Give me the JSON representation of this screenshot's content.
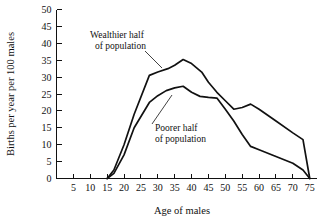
{
  "chart_data": {
    "type": "line",
    "title": "",
    "xlabel": "Age of males",
    "ylabel": "Births per year per 100 males",
    "xlim": [
      0,
      77
    ],
    "ylim": [
      0,
      50
    ],
    "grid": false,
    "legend_position": "inline-annotations",
    "x_ticks": [
      5,
      10,
      15,
      20,
      25,
      30,
      35,
      40,
      45,
      50,
      55,
      60,
      65,
      70,
      75
    ],
    "y_ticks": [
      0,
      5,
      10,
      15,
      20,
      25,
      30,
      35,
      40,
      45,
      50
    ],
    "annotations": [
      {
        "text_line1": "Wealthier half",
        "text_line2": "of population",
        "points_to_series": "Wealthier half of population"
      },
      {
        "text_line1": "Poorer half",
        "text_line2": "of population",
        "points_to_series": "Poorer half of population"
      }
    ],
    "series": [
      {
        "name": "Wealthier half of population",
        "x": [
          15,
          17,
          20,
          23,
          27.5,
          30,
          33,
          35,
          37.5,
          40,
          43,
          45,
          47.5,
          50,
          52.5,
          55,
          57.5,
          60,
          65,
          70,
          73,
          75
        ],
        "values": [
          0,
          2.5,
          10,
          19,
          30.5,
          31.5,
          32.5,
          33.5,
          35.2,
          34,
          31.5,
          28.5,
          25.5,
          23,
          20.5,
          21,
          22,
          20.5,
          17,
          13.5,
          11.5,
          0
        ]
      },
      {
        "name": "Poorer half of population",
        "x": [
          15,
          17,
          20,
          23,
          27.5,
          30,
          32.5,
          35,
          37.5,
          40,
          42.5,
          45,
          47.5,
          50,
          52.5,
          55,
          57.5,
          60,
          65,
          70,
          73,
          75
        ],
        "values": [
          0,
          1.5,
          7,
          15,
          22.5,
          24.5,
          26,
          26.8,
          27.3,
          25.5,
          24.3,
          24,
          23.8,
          20.5,
          17,
          13,
          9.5,
          8.5,
          6.5,
          4.5,
          2.5,
          0
        ]
      }
    ]
  }
}
